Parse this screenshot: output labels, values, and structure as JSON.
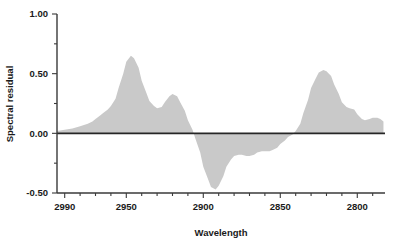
{
  "chart_data": {
    "type": "area",
    "title": "",
    "xlabel": "Wavelength",
    "ylabel": "Spectral residual",
    "xlim": [
      2995,
      2782
    ],
    "ylim": [
      -0.5,
      1.0
    ],
    "x_inverted": true,
    "grid": false,
    "legend": null,
    "y_ticks_major": [
      "1.00",
      "0.50",
      "0.00",
      "-0.50"
    ],
    "y_tick_values_major": [
      1.0,
      0.5,
      0.0,
      -0.5
    ],
    "y_tick_values_minor": [
      0.75,
      0.25,
      -0.25
    ],
    "x_ticks_major": [
      "2990",
      "2950",
      "2900",
      "2850",
      "2800"
    ],
    "x_tick_values_major": [
      2990,
      2950,
      2900,
      2850,
      2800
    ],
    "x_tick_values_minor": [
      2980,
      2970,
      2960,
      2940,
      2930,
      2920,
      2910,
      2890,
      2880,
      2870,
      2860,
      2840,
      2830,
      2820,
      2810,
      2790
    ],
    "series_name": "Spectral residual",
    "fill_color": "#c9c9c9",
    "zero_line_color": "#262626",
    "x": [
      2995,
      2990,
      2985,
      2980,
      2975,
      2972,
      2970,
      2967,
      2965,
      2962,
      2960,
      2957,
      2955,
      2952,
      2950,
      2947,
      2945,
      2942,
      2940,
      2937,
      2935,
      2932,
      2930,
      2927,
      2925,
      2922,
      2920,
      2917,
      2915,
      2912,
      2910,
      2907,
      2905,
      2902,
      2900,
      2897,
      2895,
      2892,
      2890,
      2887,
      2885,
      2882,
      2880,
      2877,
      2875,
      2872,
      2870,
      2867,
      2865,
      2862,
      2860,
      2857,
      2855,
      2852,
      2850,
      2847,
      2845,
      2842,
      2840,
      2837,
      2835,
      2832,
      2830,
      2827,
      2825,
      2822,
      2820,
      2817,
      2815,
      2812,
      2810,
      2807,
      2805,
      2802,
      2800,
      2797,
      2795,
      2792,
      2790,
      2787,
      2785,
      2783
    ],
    "y": [
      0.02,
      0.03,
      0.04,
      0.06,
      0.08,
      0.1,
      0.12,
      0.15,
      0.17,
      0.2,
      0.23,
      0.29,
      0.38,
      0.5,
      0.6,
      0.65,
      0.63,
      0.55,
      0.44,
      0.34,
      0.27,
      0.23,
      0.21,
      0.22,
      0.26,
      0.31,
      0.33,
      0.31,
      0.26,
      0.19,
      0.11,
      0.03,
      -0.05,
      -0.16,
      -0.28,
      -0.38,
      -0.45,
      -0.47,
      -0.44,
      -0.36,
      -0.28,
      -0.22,
      -0.19,
      -0.18,
      -0.18,
      -0.19,
      -0.19,
      -0.18,
      -0.16,
      -0.15,
      -0.15,
      -0.15,
      -0.14,
      -0.12,
      -0.09,
      -0.06,
      -0.03,
      -0.01,
      0.02,
      0.08,
      0.17,
      0.28,
      0.38,
      0.46,
      0.51,
      0.53,
      0.52,
      0.48,
      0.41,
      0.33,
      0.26,
      0.22,
      0.21,
      0.2,
      0.16,
      0.12,
      0.11,
      0.12,
      0.13,
      0.13,
      0.12,
      0.1
    ],
    "y_tail_x": [
      2783,
      2780
    ],
    "peaks": [
      {
        "x": 2947,
        "y": 0.65,
        "label": "primary positive peak"
      },
      {
        "x": 2920,
        "y": 0.33,
        "label": "secondary positive peak"
      },
      {
        "x": 2892,
        "y": -0.47,
        "label": "primary negative trough"
      },
      {
        "x": 2822,
        "y": 0.53,
        "label": "third positive peak"
      },
      {
        "x": 2792,
        "y": 0.13,
        "label": "minor positive bump"
      }
    ]
  },
  "axes": {
    "x_title": "Wavelength",
    "y_title": "Spectral residual"
  }
}
